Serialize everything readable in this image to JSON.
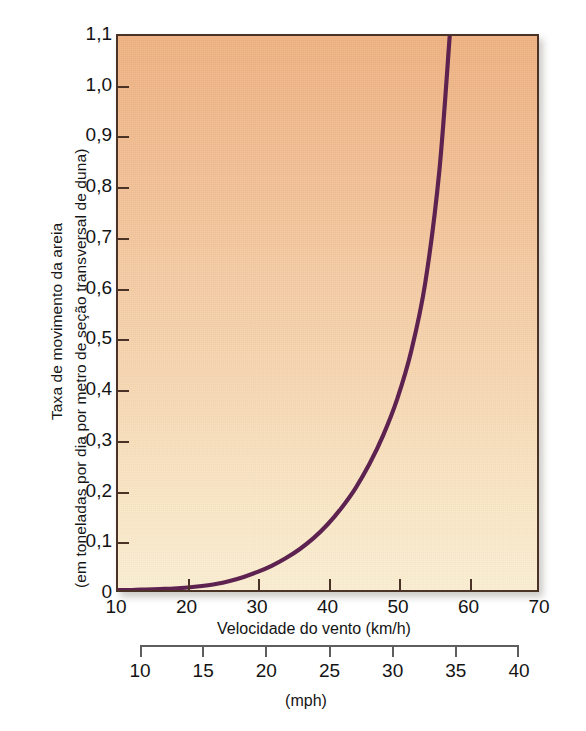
{
  "chart_data": {
    "type": "line",
    "title": "",
    "xlabel": "Velocidade do vento (km/h)",
    "ylabel_line1": "Taxa de movimento da areia",
    "ylabel_line2": "(em toneladas por dia por metro de seção transversal de duna)",
    "secondary_xlabel": "(mph)",
    "xlim": [
      10,
      70
    ],
    "ylim": [
      0,
      1.1
    ],
    "secondary_xlim": [
      10,
      40
    ],
    "grid": false,
    "legend": null,
    "x_ticks": [
      "10",
      "20",
      "30",
      "40",
      "50",
      "60",
      "70"
    ],
    "x_tick_values": [
      10,
      20,
      30,
      40,
      50,
      60,
      70
    ],
    "y_ticks": [
      "0",
      "0,1",
      "0,2",
      "0,3",
      "0,4",
      "0,5",
      "0,6",
      "0,7",
      "0,8",
      "0,9",
      "1,0",
      "1,1"
    ],
    "y_tick_values": [
      0,
      0.1,
      0.2,
      0.3,
      0.4,
      0.5,
      0.6,
      0.7,
      0.8,
      0.9,
      1.0,
      1.1
    ],
    "secondary_x_ticks": [
      "10",
      "15",
      "20",
      "25",
      "30",
      "35",
      "40"
    ],
    "secondary_x_tick_values": [
      10,
      15,
      20,
      25,
      30,
      35,
      40
    ],
    "series": [
      {
        "name": "Taxa de movimento da areia",
        "color": "#5d2250",
        "x": [
          10,
          12,
          14,
          16,
          18,
          20,
          22,
          24,
          26,
          28,
          30,
          32,
          34,
          36,
          38,
          40,
          42,
          44,
          46,
          48,
          50,
          52,
          54,
          56,
          57.5
        ],
        "y": [
          0.0,
          0.0,
          0.001,
          0.002,
          0.003,
          0.005,
          0.008,
          0.012,
          0.018,
          0.026,
          0.036,
          0.048,
          0.063,
          0.081,
          0.103,
          0.13,
          0.163,
          0.202,
          0.25,
          0.308,
          0.38,
          0.475,
          0.61,
          0.83,
          1.1
        ]
      }
    ],
    "colors": {
      "curve": "#5d2250",
      "plot_bg_top": "#efb281",
      "plot_bg_bottom": "#fbeed2",
      "frame": "#4a3326",
      "secondary_axis": "#5e5e5e",
      "text": "#141414"
    }
  }
}
